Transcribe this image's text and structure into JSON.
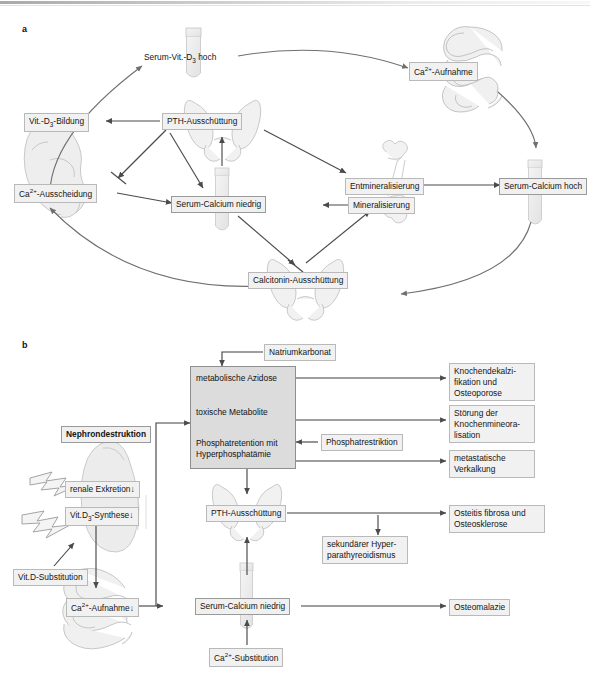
{
  "figure": {
    "panel_a_letter": "a",
    "panel_b_letter": "b"
  },
  "panel_a": {
    "nodes": {
      "serum_vit_d3_hoch": "Serum-Vit.-D₃ hoch",
      "ca_aufnahme": "Ca²⁺-Aufnahme",
      "vit_d3_bildung": "Vit.-D₃-Bildung",
      "pth_ausschuettung": "PTH-Ausschüttung",
      "ca_ausscheidung": "Ca²⁺-Ausscheidung",
      "entmineralisierung": "Entmineralisierung",
      "serum_calcium_hoch": "Serum-Calcium hoch",
      "serum_calcium_niedrig": "Serum-Calcium niedrig",
      "mineralisierung": "Mineralisierung",
      "calcitonin_ausschuettung": "Calcitonin-Ausschüttung"
    },
    "organs": {
      "test_tube_top": "test-tube-icon",
      "intestine": "intestine-icon",
      "kidney": "kidney-icon",
      "thyroid_pth": "thyroid-gland-icon",
      "bone": "bone-icon",
      "test_tube_center": "test-tube-icon",
      "test_tube_right": "test-tube-icon",
      "thyroid_calcitonin": "thyroid-gland-icon"
    }
  },
  "panel_b": {
    "nodes": {
      "natriumkarbonat": "Natriumkarbonat",
      "metabolische_azidose": "metabolische Azidose",
      "toxische_metabolite": "toxische Metabolite",
      "phosphatretention_l1": "Phosphatretention mit",
      "phosphatretention_l2": "Hyperphosphatämie",
      "phosphatrestriktion": "Phosphatrestriktion",
      "nephrondestruktion": "Nephrondestruktion",
      "renale_exkretion": "renale Exkretion",
      "vit_d3_synthese": "Vit.D₃-Synthese",
      "vit_d_substitution": "Vit.D-Substitution",
      "ca_aufnahme": "Ca²⁺-Aufnahme",
      "pth_ausschuettung": "PTH-Ausschüttung",
      "sekundaerer_hyperparathyreoidismus_l1": "sekundärer Hyper-",
      "sekundaerer_hyperparathyreoidismus_l2": "parathyreoidismus",
      "serum_calcium_niedrig": "Serum-Calcium niedrig",
      "ca_substitution": "Ca²⁺-Substitution",
      "knochendekalzifikation_l1": "Knochendekalzi-",
      "knochendekalzifikation_l2": "fikation und",
      "knochendekalzifikation_l3": "Osteoporose",
      "stoerung_mineralisation_l1": "Störung der",
      "stoerung_mineralisation_l2": "Knochenmineora-",
      "stoerung_mineralisation_l3": "lisation",
      "metastatische_verkalkung_l1": "metastatische",
      "metastatische_verkalkung_l2": "Verkalkung",
      "osteitis_fibrosa_l1": "Osteitis fibrosa und",
      "osteitis_fibrosa_l2": "Osteosklerose",
      "osteomalazie": "Osteomalazie"
    },
    "symbols": {
      "decrease_arrow": "↓",
      "lightning_1": "lightning-bolt-icon",
      "lightning_2": "lightning-bolt-icon"
    },
    "organs": {
      "kidney": "kidney-icon",
      "intestine": "intestine-icon",
      "thyroid_pth": "thyroid-gland-icon",
      "test_tube": "test-tube-icon"
    }
  },
  "colors": {
    "box_fill": "#f1f1f1",
    "box_border": "#b9b9b9",
    "big_box_fill": "#dcdcdc",
    "big_box_border": "#8f8f8f",
    "arrow": "#4b4b4b",
    "organ_line": "#b4b4b4",
    "organ_fill": "#ededed"
  }
}
